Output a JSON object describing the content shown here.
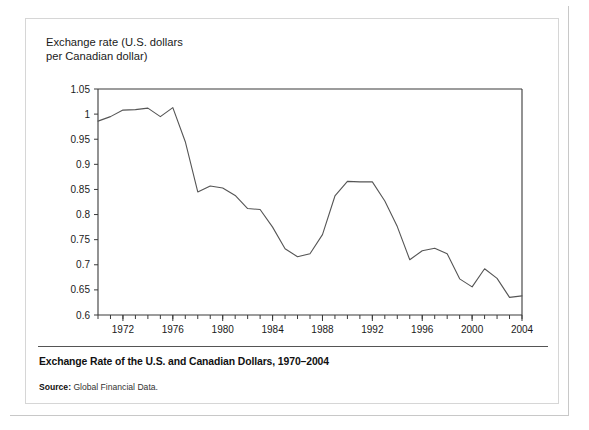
{
  "figure": {
    "axis_title": "Exchange rate (U.S. dollars\nper Canadian dollar)",
    "caption": "Exchange Rate of the U.S. and Canadian Dollars, 1970–2004",
    "source_label": "Source:",
    "source_text": " Global Financial Data.",
    "line_color": "#555555",
    "axis_color": "#3a3a3a",
    "panel_background": "#ffffff"
  },
  "chart_data": {
    "type": "line",
    "title": "Exchange Rate of the U.S. and Canadian Dollars, 1970–2004",
    "subtitle": "",
    "xlabel": "",
    "ylabel": "Exchange rate (U.S. dollars per Canadian dollar)",
    "xlim": [
      1970,
      2004
    ],
    "ylim": [
      0.6,
      1.05
    ],
    "grid": false,
    "legend": "none",
    "y_ticks": [
      0.6,
      0.65,
      0.7,
      0.75,
      0.8,
      0.85,
      0.9,
      0.95,
      1,
      1.05
    ],
    "y_tick_labels": [
      "0.6",
      "0.65",
      "0.7",
      "0.75",
      "0.8",
      "0.85",
      "0.9",
      "0.95",
      "1",
      "1.05"
    ],
    "x_ticks_major": [
      1972,
      1976,
      1980,
      1984,
      1988,
      1992,
      1996,
      2000,
      2004
    ],
    "x_tick_labels": [
      "1972",
      "1976",
      "1980",
      "1984",
      "1988",
      "1992",
      "1996",
      "2000",
      "2004"
    ],
    "x_tick_minor_step": 1,
    "x": [
      1970,
      1971,
      1972,
      1973,
      1974,
      1975,
      1976,
      1977,
      1978,
      1979,
      1980,
      1981,
      1982,
      1983,
      1984,
      1985,
      1986,
      1987,
      1988,
      1989,
      1990,
      1991,
      1992,
      1993,
      1994,
      1995,
      1996,
      1997,
      1998,
      1999,
      2000,
      2001,
      2002,
      2003,
      2004
    ],
    "series": [
      {
        "name": "U.S. dollars per Canadian dollar",
        "values": [
          0.986,
          0.995,
          1.008,
          1.009,
          1.012,
          0.995,
          1.013,
          0.945,
          0.845,
          0.857,
          0.853,
          0.838,
          0.812,
          0.81,
          0.775,
          0.732,
          0.716,
          0.722,
          0.76,
          0.837,
          0.866,
          0.865,
          0.865,
          0.827,
          0.776,
          0.71,
          0.728,
          0.733,
          0.722,
          0.672,
          0.656,
          0.692,
          0.673,
          0.635,
          0.638
        ]
      }
    ],
    "annotations": []
  }
}
